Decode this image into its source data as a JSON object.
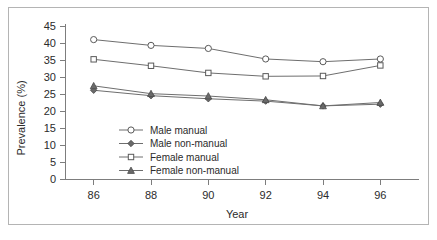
{
  "figure": {
    "border_color": "#b4b4b4",
    "background": "#ffffff",
    "line_color": "#6e6e6e"
  },
  "chart_data": {
    "type": "line",
    "title": "",
    "xlabel": "Year",
    "ylabel": "Prevalence (%)",
    "x": [
      86,
      88,
      90,
      92,
      94,
      96
    ],
    "xtick_labels": [
      "86",
      "88",
      "90",
      "92",
      "94",
      "96"
    ],
    "ytick_labels": [
      "0",
      "5",
      "10",
      "15",
      "20",
      "25",
      "30",
      "35",
      "40",
      "45"
    ],
    "ylim": [
      0,
      45
    ],
    "xlim": [
      85,
      97
    ],
    "grid": false,
    "legend_position": "inside-lower-left",
    "series": [
      {
        "name": "Male manual",
        "marker": "open-circle",
        "values": [
          41.0,
          39.3,
          38.4,
          35.3,
          34.5,
          35.3
        ]
      },
      {
        "name": "Male non-manual",
        "marker": "filled-diamond",
        "values": [
          26.1,
          24.5,
          23.6,
          22.9,
          21.5,
          22.0
        ]
      },
      {
        "name": "Female manual",
        "marker": "open-square",
        "values": [
          35.2,
          33.3,
          31.2,
          30.2,
          30.3,
          33.4
        ]
      },
      {
        "name": "Female non-manual",
        "marker": "filled-triangle",
        "values": [
          27.4,
          25.1,
          24.4,
          23.3,
          21.5,
          22.5
        ]
      }
    ]
  },
  "legend": {
    "entries": [
      {
        "label": "Male manual"
      },
      {
        "label": "Male non-manual"
      },
      {
        "label": "Female manual"
      },
      {
        "label": "Female non-manual"
      }
    ]
  }
}
